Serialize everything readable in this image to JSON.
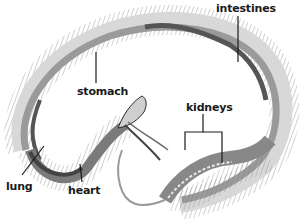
{
  "diagram": {
    "labels": [
      {
        "id": "intestines",
        "text": "intestines",
        "x": 216,
        "y": 2
      },
      {
        "id": "stomach",
        "text": "stomach",
        "x": 77,
        "y": 85
      },
      {
        "id": "kidneys",
        "text": "kidneys",
        "x": 186,
        "y": 101
      },
      {
        "id": "lung",
        "text": "lung",
        "x": 6,
        "y": 180
      },
      {
        "id": "heart",
        "text": "heart",
        "x": 68,
        "y": 184
      }
    ],
    "colors": {
      "outline": "#2a2a2a",
      "ribs": "#8a8a8a",
      "organ_dark": "#555555",
      "organ_mid": "#9a9a9a",
      "body_light": "#d8d8d8",
      "label": "#1a1a1a"
    }
  }
}
